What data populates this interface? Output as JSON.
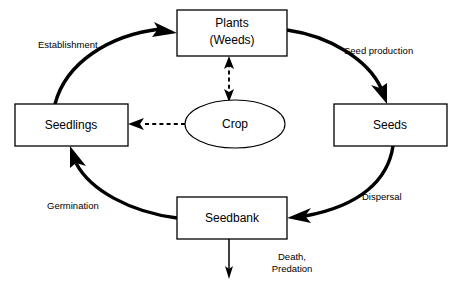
{
  "diagram": {
    "background_color": "#ffffff",
    "line_color": "#000000",
    "nodes": [
      {
        "id": "plants",
        "shape": "rectangle",
        "label_line1": "Plants",
        "label_line2": "(Weeds)"
      },
      {
        "id": "seeds",
        "shape": "rectangle",
        "label_line1": "Seeds",
        "label_line2": ""
      },
      {
        "id": "seedbank",
        "shape": "rectangle",
        "label_line1": "Seedbank",
        "label_line2": ""
      },
      {
        "id": "seedlings",
        "shape": "rectangle",
        "label_line1": "Seedlings",
        "label_line2": ""
      },
      {
        "id": "crop",
        "shape": "ellipse",
        "label_line1": "Crop",
        "label_line2": ""
      }
    ],
    "edges": [
      {
        "id": "establishment",
        "from": "seedlings",
        "to": "plants",
        "label": "Establishment",
        "style": "solid-thick"
      },
      {
        "id": "seed-production",
        "from": "plants",
        "to": "seeds",
        "label": "Seed production",
        "style": "solid-thick"
      },
      {
        "id": "dispersal",
        "from": "seeds",
        "to": "seedbank",
        "label": "Dispersal",
        "style": "solid-thick"
      },
      {
        "id": "germination",
        "from": "seedbank",
        "to": "seedlings",
        "label": "Germination",
        "style": "solid-thick"
      },
      {
        "id": "death-predation",
        "from": "seedbank",
        "to": "",
        "label_line1": "Death,",
        "label_line2": "Predation",
        "style": "solid-thin"
      },
      {
        "id": "crop-plants",
        "from": "crop",
        "to": "plants",
        "label": "",
        "style": "dashed-double"
      },
      {
        "id": "crop-seedlings",
        "from": "crop",
        "to": "seedlings",
        "label": "",
        "style": "dashed"
      }
    ]
  }
}
